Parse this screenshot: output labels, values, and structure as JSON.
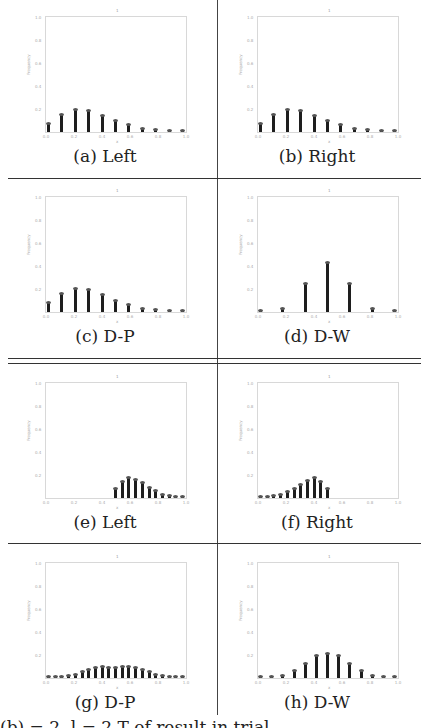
{
  "figure": {
    "bottom_caption_clipped": "(b)      = 2, l = 2 T                              of result in trial",
    "panels": [
      {
        "id": "a",
        "caption": "(a) Left"
      },
      {
        "id": "b",
        "caption": "(b) Right"
      },
      {
        "id": "c",
        "caption": "(c) D-P"
      },
      {
        "id": "d",
        "caption": "(d) D-W"
      },
      {
        "id": "e",
        "caption": "(e) Left"
      },
      {
        "id": "f",
        "caption": "(f) Right"
      },
      {
        "id": "g",
        "caption": "(g) D-P"
      },
      {
        "id": "h",
        "caption": "(h) D-W"
      }
    ],
    "plot_title": "1",
    "ylabel": "Frequency",
    "xlabel": "x",
    "yticks": [
      "1.0",
      "0.8",
      "0.6",
      "0.4",
      "0.2"
    ],
    "xticks": [
      "0.0",
      "0.2",
      "0.4",
      "0.6",
      "0.8",
      "1.0"
    ]
  },
  "chart_data": [
    {
      "type": "bar",
      "title": "(a) Left",
      "xlabel": "x",
      "ylabel": "Frequency",
      "ylim": [
        0,
        1.0
      ],
      "xlim": [
        0,
        1.0
      ],
      "grid": false,
      "x": [
        0.0,
        0.1,
        0.2,
        0.3,
        0.4,
        0.5,
        0.6,
        0.7,
        0.8,
        0.9,
        1.0
      ],
      "values": [
        0.07,
        0.15,
        0.19,
        0.18,
        0.14,
        0.1,
        0.06,
        0.03,
        0.02,
        0.01,
        0.01
      ]
    },
    {
      "type": "bar",
      "title": "(b) Right",
      "xlabel": "x",
      "ylabel": "Frequency",
      "ylim": [
        0,
        1.0
      ],
      "xlim": [
        0,
        1.0
      ],
      "grid": false,
      "x": [
        0.0,
        0.1,
        0.2,
        0.3,
        0.4,
        0.5,
        0.6,
        0.7,
        0.8,
        0.9,
        1.0
      ],
      "values": [
        0.07,
        0.15,
        0.19,
        0.18,
        0.14,
        0.1,
        0.06,
        0.03,
        0.02,
        0.01,
        0.01
      ]
    },
    {
      "type": "bar",
      "title": "(c) D-P",
      "xlabel": "x",
      "ylabel": "Frequency",
      "ylim": [
        0,
        1.0
      ],
      "xlim": [
        0,
        1.0
      ],
      "grid": false,
      "x": [
        0.0,
        0.1,
        0.2,
        0.3,
        0.4,
        0.5,
        0.6,
        0.7,
        0.8,
        0.9,
        1.0
      ],
      "values": [
        0.08,
        0.16,
        0.2,
        0.19,
        0.15,
        0.1,
        0.06,
        0.03,
        0.02,
        0.01,
        0.01
      ]
    },
    {
      "type": "bar",
      "title": "(d) D-W",
      "xlabel": "x",
      "ylabel": "Frequency",
      "ylim": [
        0,
        1.0
      ],
      "xlim": [
        0,
        1.0
      ],
      "grid": false,
      "x": [
        0.0,
        0.167,
        0.333,
        0.5,
        0.667,
        0.833,
        1.0
      ],
      "values": [
        0.0,
        0.03,
        0.24,
        0.43,
        0.24,
        0.03,
        0.0
      ]
    },
    {
      "type": "bar",
      "title": "(e) Left",
      "xlabel": "x",
      "ylabel": "Frequency",
      "ylim": [
        0,
        1.0
      ],
      "xlim": [
        0,
        1.0
      ],
      "grid": false,
      "x": [
        0.5,
        0.55,
        0.6,
        0.65,
        0.7,
        0.75,
        0.8,
        0.85,
        0.9,
        0.95,
        1.0
      ],
      "values": [
        0.08,
        0.14,
        0.17,
        0.16,
        0.13,
        0.09,
        0.06,
        0.03,
        0.02,
        0.01,
        0.01
      ]
    },
    {
      "type": "bar",
      "title": "(f) Right",
      "xlabel": "x",
      "ylabel": "Frequency",
      "ylim": [
        0,
        1.0
      ],
      "xlim": [
        0,
        1.0
      ],
      "grid": false,
      "x": [
        0.0,
        0.05,
        0.1,
        0.15,
        0.2,
        0.25,
        0.3,
        0.35,
        0.4,
        0.45,
        0.5
      ],
      "values": [
        0.01,
        0.01,
        0.02,
        0.03,
        0.05,
        0.08,
        0.11,
        0.15,
        0.17,
        0.14,
        0.08
      ]
    },
    {
      "type": "bar",
      "title": "(g) D-P",
      "xlabel": "x",
      "ylabel": "Frequency",
      "ylim": [
        0,
        1.0
      ],
      "xlim": [
        0,
        1.0
      ],
      "grid": false,
      "x": [
        0.0,
        0.05,
        0.1,
        0.15,
        0.2,
        0.25,
        0.3,
        0.35,
        0.4,
        0.45,
        0.5,
        0.55,
        0.6,
        0.65,
        0.7,
        0.75,
        0.8,
        0.85,
        0.9,
        0.95,
        1.0
      ],
      "values": [
        0.01,
        0.01,
        0.01,
        0.02,
        0.03,
        0.05,
        0.07,
        0.09,
        0.1,
        0.09,
        0.09,
        0.1,
        0.1,
        0.09,
        0.07,
        0.05,
        0.03,
        0.02,
        0.01,
        0.01,
        0.01
      ]
    },
    {
      "type": "bar",
      "title": "(h) D-W",
      "xlabel": "x",
      "ylabel": "Frequency",
      "ylim": [
        0,
        1.0
      ],
      "xlim": [
        0,
        1.0
      ],
      "grid": false,
      "x": [
        0.0,
        0.083,
        0.167,
        0.25,
        0.333,
        0.417,
        0.5,
        0.583,
        0.667,
        0.75,
        0.833,
        0.917,
        1.0
      ],
      "values": [
        0.0,
        0.01,
        0.02,
        0.06,
        0.12,
        0.19,
        0.21,
        0.19,
        0.12,
        0.06,
        0.02,
        0.01,
        0.0
      ]
    }
  ]
}
